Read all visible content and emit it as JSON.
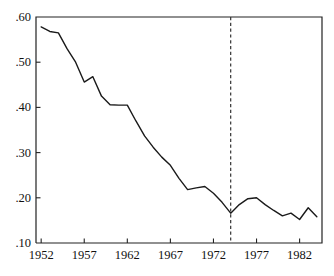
{
  "chart_data": {
    "type": "line",
    "title": "",
    "subtitle": "",
    "xlabel": "",
    "ylabel": "",
    "xlim": [
      1951.4,
      1984.6
    ],
    "ylim": [
      0.1,
      0.6
    ],
    "grid": false,
    "legend": null,
    "legend_position": "none",
    "y_tick_labels": [
      ".60",
      ".50",
      ".40",
      ".30",
      ".20",
      ".10"
    ],
    "y_tick_values": [
      0.6,
      0.5,
      0.4,
      0.3,
      0.2,
      0.1
    ],
    "x_tick_labels": [
      "1952",
      "1957",
      "1962",
      "1967",
      "1972",
      "1977",
      "1982"
    ],
    "x_tick_values": [
      1952,
      1957,
      1962,
      1967,
      1972,
      1977,
      1982
    ],
    "annotations": [
      {
        "name": "vertical-dashed-reference-line",
        "type": "vline",
        "x": 1974,
        "style": "dashed",
        "color": "#333333",
        "label": ""
      }
    ],
    "series": [
      {
        "name": "series-1",
        "color": "#1a1a1a",
        "line_width": 1.4,
        "x": [
          1952,
          1953,
          1954,
          1955,
          1956,
          1957,
          1958,
          1959,
          1960,
          1961,
          1962,
          1963,
          1964,
          1965,
          1966,
          1967,
          1968,
          1969,
          1970,
          1971,
          1972,
          1973,
          1974,
          1975,
          1976,
          1977,
          1978,
          1979,
          1980,
          1981,
          1982,
          1983,
          1984
        ],
        "values": [
          0.578,
          0.568,
          0.565,
          0.53,
          0.5,
          0.456,
          0.468,
          0.425,
          0.406,
          0.405,
          0.405,
          0.37,
          0.337,
          0.312,
          0.29,
          0.272,
          0.243,
          0.218,
          0.222,
          0.225,
          0.21,
          0.19,
          0.166,
          0.185,
          0.198,
          0.2,
          0.185,
          0.172,
          0.16,
          0.166,
          0.152,
          0.178,
          0.158
        ]
      }
    ]
  },
  "axes": {
    "y_axis_name": "y-axis",
    "x_axis_name": "x-axis"
  }
}
